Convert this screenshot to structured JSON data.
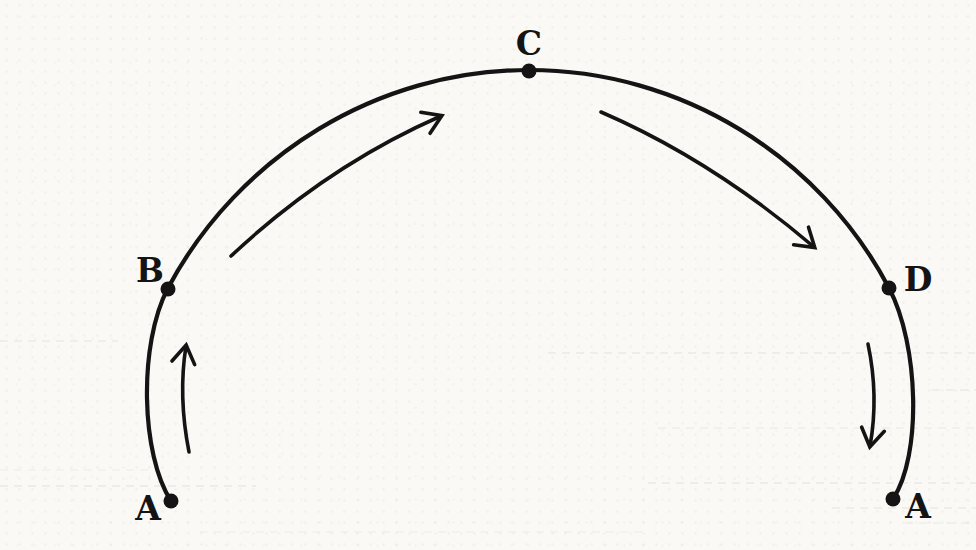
{
  "figure": {
    "type": "scanned-physics-diagram",
    "points": [
      {
        "id": "point-a-left",
        "label": "A",
        "position_hint": "bottom-left end of arc"
      },
      {
        "id": "point-b",
        "label": "B",
        "position_hint": "left side of arc"
      },
      {
        "id": "point-c",
        "label": "C",
        "position_hint": "top of arc"
      },
      {
        "id": "point-d",
        "label": "D",
        "position_hint": "right side of arc"
      },
      {
        "id": "point-a-right",
        "label": "A",
        "position_hint": "bottom-right end of arc"
      }
    ],
    "arrows": [
      {
        "id": "arrow-a-to-b",
        "direction": "upward along left side"
      },
      {
        "id": "arrow-b-to-c",
        "direction": "up and right toward top"
      },
      {
        "id": "arrow-c-to-d",
        "direction": "down and right from top"
      },
      {
        "id": "arrow-d-to-a",
        "direction": "downward along right side"
      }
    ],
    "colors": {
      "ink": "#141414",
      "paper": "#faf9f6",
      "bleedthrough": "#a39d90"
    }
  }
}
